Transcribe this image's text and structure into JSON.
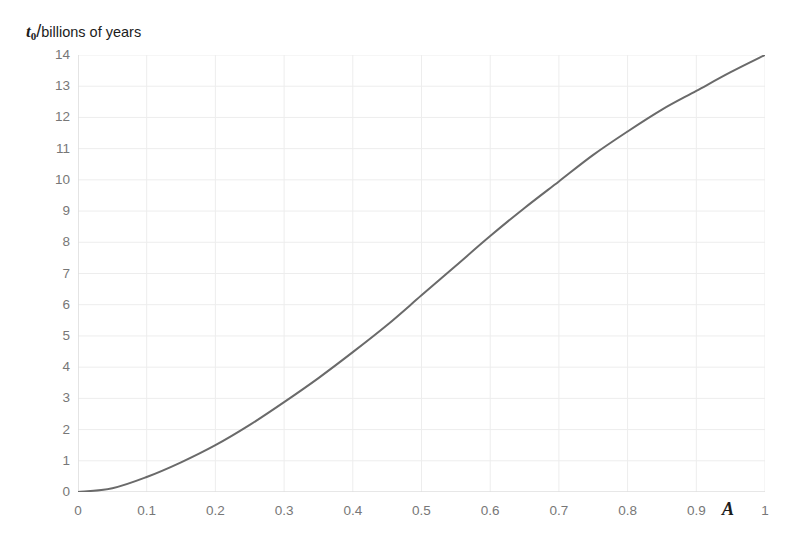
{
  "chart_data": {
    "type": "line",
    "title": "",
    "xlabel": "A",
    "ylabel": "t0/billions of years",
    "ylabel_parts": {
      "symbol": "t",
      "subscript": "0",
      "separator": "/",
      "text": "billions of years"
    },
    "xlim": [
      0,
      1
    ],
    "ylim": [
      0,
      14
    ],
    "grid": true,
    "grid_color": "#ededed",
    "legend": "none",
    "line_color": "#6a6a6a",
    "line_width": 2,
    "xticks": [
      "0",
      "0.1",
      "0.2",
      "0.3",
      "0.4",
      "0.5",
      "0.6",
      "0.7",
      "0.8",
      "0.9",
      "1"
    ],
    "xtick_values": [
      0,
      0.1,
      0.2,
      0.3,
      0.4,
      0.5,
      0.6,
      0.7,
      0.8,
      0.9,
      1
    ],
    "yticks": [
      "0",
      "1",
      "2",
      "3",
      "4",
      "5",
      "6",
      "7",
      "8",
      "9",
      "10",
      "11",
      "12",
      "13",
      "14"
    ],
    "ytick_values": [
      0,
      1,
      2,
      3,
      4,
      5,
      6,
      7,
      8,
      9,
      10,
      11,
      12,
      13,
      14
    ],
    "x": [
      0,
      0.05,
      0.1,
      0.15,
      0.2,
      0.25,
      0.3,
      0.35,
      0.4,
      0.45,
      0.5,
      0.55,
      0.6,
      0.65,
      0.7,
      0.75,
      0.8,
      0.85,
      0.9,
      0.95,
      1
    ],
    "values": [
      0.0,
      0.12,
      0.48,
      0.95,
      1.5,
      2.15,
      2.88,
      3.65,
      4.48,
      5.35,
      6.3,
      7.25,
      8.2,
      9.1,
      9.95,
      10.8,
      11.55,
      12.25,
      12.85,
      13.45,
      14.0
    ],
    "series": [
      {
        "name": "t0(A)",
        "values": [
          0.0,
          0.12,
          0.48,
          0.95,
          1.5,
          2.15,
          2.88,
          3.65,
          4.48,
          5.35,
          6.3,
          7.25,
          8.2,
          9.1,
          9.95,
          10.8,
          11.55,
          12.25,
          12.85,
          13.45,
          14.0
        ]
      }
    ]
  }
}
